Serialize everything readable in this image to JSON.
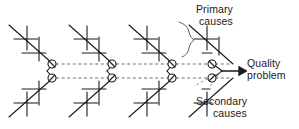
{
  "diagram": {
    "type": "fishbone-cause-and-effect",
    "title": "",
    "labels": {
      "primary_causes_line1": "Primary",
      "primary_causes_line2": "causes",
      "quality_problem_line1": "Quality",
      "quality_problem_line2": "problem",
      "secondary_causes_line1": "Secondary",
      "secondary_causes_line2": "causes"
    },
    "colors": {
      "stroke": "#1a1a1a",
      "dashed": "#6e6e6e",
      "text": "#1a1a1a",
      "background": "#ffffff"
    },
    "structure": {
      "module_count": 4,
      "module_x_starts": [
        8,
        68,
        128,
        188
      ],
      "upper_node_y": 64,
      "lower_node_y": 78,
      "node_radius": 4,
      "arrow_tip_x": 245,
      "arrow_y": 71,
      "tick_marks_per_branch": 3
    }
  }
}
